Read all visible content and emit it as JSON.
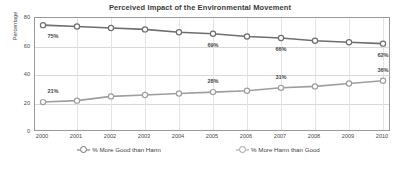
{
  "chart_data": {
    "type": "line",
    "title": "Perceived Impact of the Environmental Movement",
    "xlabel": "",
    "ylabel": "Percentage",
    "x": [
      2000,
      2001,
      2002,
      2003,
      2004,
      2005,
      2006,
      2007,
      2008,
      2009,
      2010
    ],
    "categories": [
      "2000",
      "2001",
      "2002",
      "2003",
      "2004",
      "2005",
      "2006",
      "2007",
      "2008",
      "2009",
      "2010"
    ],
    "ylim": [
      0,
      80
    ],
    "yticks": [
      0,
      20,
      40,
      60,
      80
    ],
    "ytick_labels": [
      "0",
      "20",
      "40",
      "60",
      "80"
    ],
    "grid": true,
    "legend_position": "bottom",
    "series": [
      {
        "name": "% More Good than Harm",
        "color": "#6e6e6e",
        "values": [
          75,
          74,
          73,
          72,
          70,
          69,
          67,
          66,
          64,
          63,
          62
        ],
        "labels": [
          {
            "index": 0,
            "text": "75%"
          },
          {
            "index": 5,
            "text": "69%"
          },
          {
            "index": 7,
            "text": "66%"
          },
          {
            "index": 10,
            "text": "62%"
          }
        ]
      },
      {
        "name": "% More Harm than Good",
        "color": "#9e9e9e",
        "values": [
          21,
          22,
          25,
          26,
          27,
          28,
          29,
          31,
          32,
          34,
          36
        ],
        "labels": [
          {
            "index": 0,
            "text": "21%"
          },
          {
            "index": 5,
            "text": "28%"
          },
          {
            "index": 7,
            "text": "31%"
          },
          {
            "index": 10,
            "text": "36%"
          }
        ]
      }
    ]
  },
  "colors": {
    "series_good": "#6e6e6e",
    "series_harm": "#9e9e9e",
    "axis": "#9a9a9a",
    "grid": "#d9d9d9",
    "text": "#4a4a4a",
    "background": "#ffffff"
  },
  "legend": {
    "items": [
      {
        "label": "% More Good than Harm",
        "marker": "circle-marker",
        "color": "#6e6e6e"
      },
      {
        "label": "% More Harm than Good",
        "marker": "circle-marker",
        "color": "#9e9e9e"
      }
    ]
  }
}
